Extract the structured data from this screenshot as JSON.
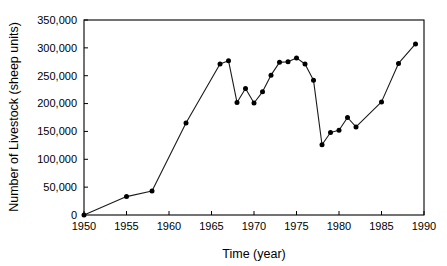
{
  "chart_data": {
    "type": "line",
    "title": "",
    "subtitle": "",
    "xlabel": "Time (year)",
    "ylabel": "Number of Livestock (sheep units)",
    "xlim": [
      1950,
      1990
    ],
    "ylim": [
      0,
      350000
    ],
    "grid": false,
    "legend": false,
    "legend_position": "none",
    "marker": "filled-circle",
    "line_color": "#1a1a1a",
    "marker_color": "#000000",
    "background_color": "#ffffff",
    "xticks": [
      1950,
      1955,
      1960,
      1965,
      1970,
      1975,
      1980,
      1985,
      1990
    ],
    "xtick_labels": [
      "1950",
      "1955",
      "1960",
      "1965",
      "1970",
      "1975",
      "1980",
      "1985",
      "1990"
    ],
    "yticks": [
      0,
      50000,
      100000,
      150000,
      200000,
      250000,
      300000,
      350000
    ],
    "ytick_labels": [
      "0",
      "50,000",
      "100,000",
      "150,000",
      "200,000",
      "250,000",
      "300,000",
      "350,000"
    ],
    "series": [
      {
        "name": "Livestock",
        "x": [
          1950,
          1955,
          1958,
          1962,
          1966,
          1967,
          1968,
          1969,
          1970,
          1971,
          1972,
          1973,
          1974,
          1975,
          1976,
          1977,
          1978,
          1979,
          1980,
          1981,
          1982,
          1985,
          1987,
          1989
        ],
        "values": [
          0,
          33000,
          43000,
          165000,
          271000,
          277000,
          202000,
          227000,
          201000,
          221000,
          251000,
          274000,
          275000,
          282000,
          271000,
          242000,
          126000,
          148000,
          152000,
          175000,
          158000,
          203000,
          272000,
          307000
        ]
      }
    ]
  }
}
